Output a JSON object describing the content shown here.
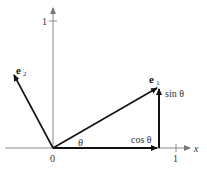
{
  "diagram": {
    "type": "rotation of unit basis vectors",
    "axes": {
      "x_label": "x",
      "y_tick_label": "1",
      "x_tick_label": "1",
      "origin_label": "0"
    },
    "vectors": [
      {
        "name": "e1",
        "label_main": "e",
        "label_sub": "1"
      },
      {
        "name": "e2",
        "label_main": "e",
        "label_sub": "2"
      }
    ],
    "components": {
      "horizontal": "cos θ",
      "vertical": "sin θ"
    },
    "angle_label": "θ",
    "colors": {
      "axis": "#888888",
      "vector": "#111111",
      "text": "#333333"
    }
  }
}
